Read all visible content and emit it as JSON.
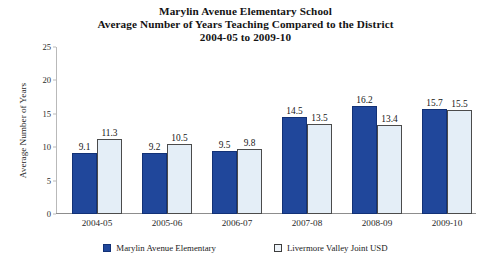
{
  "chart_data": {
    "type": "bar",
    "title": "Marylin Avenue Elementary School\nAverage Number of Years Teaching Compared to the District\n2004-05 to 2009-10",
    "title_lines": [
      "Marylin Avenue Elementary School",
      "Average Number of Years Teaching Compared to the District",
      "2004-05 to 2009-10"
    ],
    "categories": [
      "2004-05",
      "2005-06",
      "2006-07",
      "2007-08",
      "2008-09",
      "2009-10"
    ],
    "series": [
      {
        "name": "Marylin Avenue Elementary",
        "color": "#20479B",
        "values": [
          9.1,
          9.2,
          9.5,
          14.5,
          16.2,
          15.7
        ],
        "labels": [
          "9.1",
          "9.2",
          "9.5",
          "14.5",
          "16.2",
          "15.7"
        ]
      },
      {
        "name": "Livermore Valley Joint USD",
        "color": "#e4eef7",
        "values": [
          11.3,
          10.5,
          9.8,
          13.5,
          13.4,
          15.5
        ],
        "labels": [
          "11.3",
          "10.5",
          "9.8",
          "13.5",
          "13.4",
          "15.5"
        ]
      }
    ],
    "xlabel": "",
    "ylabel": "Average Number of Years",
    "ylim": [
      0,
      25
    ],
    "yticks": [
      0,
      5,
      10,
      15,
      20,
      25
    ],
    "ytick_labels": [
      "0",
      "5",
      "10",
      "15",
      "20",
      "25"
    ],
    "grid": false,
    "legend_position": "bottom"
  },
  "legend": {
    "items": [
      {
        "label": "Marylin Avenue Elementary",
        "style": "filled"
      },
      {
        "label": "Livermore Valley Joint USD",
        "style": "hollow"
      }
    ]
  }
}
